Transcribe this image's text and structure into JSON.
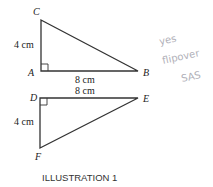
{
  "caption": "ILLUSTRATION 1",
  "triangle1": {
    "vertices": {
      "C": "C",
      "A": "A",
      "B": "B"
    },
    "side_vertical": "4 cm",
    "side_horizontal": "8 cm"
  },
  "triangle2": {
    "vertices": {
      "D": "D",
      "E": "E",
      "F": "F"
    },
    "side_vertical": "4 cm",
    "side_horizontal": "8 cm"
  },
  "handwritten_note": {
    "line1": "yes",
    "line2": "flipover",
    "line3": "SAS"
  },
  "colors": {
    "line": "#333333",
    "handwriting": "#b0b0b8"
  }
}
